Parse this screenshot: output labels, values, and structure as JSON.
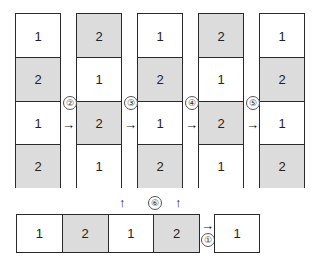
{
  "columns": [
    {
      "cells": [
        {
          "label": "1",
          "fill": "white"
        },
        {
          "label": "2",
          "fill": "shaded"
        },
        {
          "label": "1",
          "fill": "white"
        },
        {
          "label": "2",
          "fill": "shaded"
        }
      ]
    },
    {
      "cells": [
        {
          "label": "2",
          "fill": "shaded"
        },
        {
          "label": "1",
          "fill": "white"
        },
        {
          "label": "2",
          "fill": "shaded"
        },
        {
          "label": "1",
          "fill": "white"
        }
      ]
    },
    {
      "cells": [
        {
          "label": "1",
          "fill": "white"
        },
        {
          "label": "2",
          "fill": "shaded"
        },
        {
          "label": "1",
          "fill": "white"
        },
        {
          "label": "2",
          "fill": "shaded"
        }
      ]
    },
    {
      "cells": [
        {
          "label": "2",
          "fill": "shaded"
        },
        {
          "label": "1",
          "fill": "white"
        },
        {
          "label": "2",
          "fill": "shaded"
        },
        {
          "label": "1",
          "fill": "white"
        }
      ]
    },
    {
      "cells": [
        {
          "label": "1",
          "fill": "white"
        },
        {
          "label": "2",
          "fill": "shaded"
        },
        {
          "label": "1",
          "fill": "white"
        },
        {
          "label": "2",
          "fill": "shaded"
        }
      ]
    }
  ],
  "bottom_row": {
    "cells": [
      {
        "label": "1",
        "fill": "white"
      },
      {
        "label": "2",
        "fill": "shaded"
      },
      {
        "label": "1",
        "fill": "white"
      },
      {
        "label": "2",
        "fill": "shaded"
      }
    ]
  },
  "single_box": {
    "label": "1"
  },
  "step_labels": {
    "s1": "①",
    "s2": "②",
    "s3": "③",
    "s4": "④",
    "s5": "⑤",
    "s6": "⑥"
  },
  "arrows": {
    "right": "→",
    "up": "↑"
  },
  "colors": {
    "shaded": "#dcdcdc",
    "border": "#2a2a2a"
  }
}
